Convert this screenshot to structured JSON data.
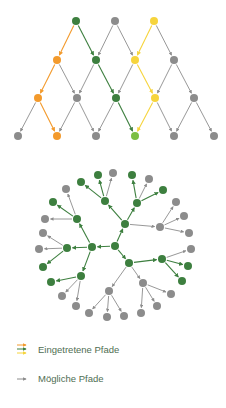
{
  "colors": {
    "green": "#3d7f3f",
    "gray": "#8c8c8c",
    "orange": "#f39a2c",
    "yellow": "#f6d43c",
    "light_green": "#7cbf43",
    "legend_text": "#4f6e52"
  },
  "lattice": {
    "nodes": [
      {
        "id": "r0a",
        "x": 76,
        "y": 21,
        "c": "green"
      },
      {
        "id": "r0b",
        "x": 115,
        "y": 21,
        "c": "gray"
      },
      {
        "id": "r0c",
        "x": 154,
        "y": 21,
        "c": "yellow"
      },
      {
        "id": "r1a",
        "x": 57,
        "y": 60,
        "c": "orange"
      },
      {
        "id": "r1b",
        "x": 96,
        "y": 60,
        "c": "green"
      },
      {
        "id": "r1c",
        "x": 135,
        "y": 60,
        "c": "yellow"
      },
      {
        "id": "r1d",
        "x": 174,
        "y": 60,
        "c": "gray"
      },
      {
        "id": "r2a",
        "x": 38,
        "y": 98,
        "c": "orange"
      },
      {
        "id": "r2b",
        "x": 77,
        "y": 98,
        "c": "gray"
      },
      {
        "id": "r2c",
        "x": 116,
        "y": 98,
        "c": "green"
      },
      {
        "id": "r2d",
        "x": 155,
        "y": 98,
        "c": "yellow"
      },
      {
        "id": "r2e",
        "x": 194,
        "y": 98,
        "c": "gray"
      },
      {
        "id": "r3a",
        "x": 18,
        "y": 136,
        "c": "gray"
      },
      {
        "id": "r3b",
        "x": 57,
        "y": 136,
        "c": "orange"
      },
      {
        "id": "r3c",
        "x": 96,
        "y": 136,
        "c": "gray"
      },
      {
        "id": "r3d",
        "x": 135,
        "y": 136,
        "c": "light_green"
      },
      {
        "id": "r3e",
        "x": 174,
        "y": 136,
        "c": "gray"
      },
      {
        "id": "r3f",
        "x": 214,
        "y": 136,
        "c": "gray"
      }
    ],
    "edges": [
      [
        "r0a",
        "r1a",
        "orange"
      ],
      [
        "r0a",
        "r1b",
        "green"
      ],
      [
        "r0b",
        "r1b",
        "gray"
      ],
      [
        "r0b",
        "r1c",
        "gray"
      ],
      [
        "r0c",
        "r1c",
        "yellow"
      ],
      [
        "r0c",
        "r1d",
        "gray"
      ],
      [
        "r1a",
        "r2a",
        "orange"
      ],
      [
        "r1a",
        "r2b",
        "gray"
      ],
      [
        "r1b",
        "r2b",
        "gray"
      ],
      [
        "r1b",
        "r2c",
        "green"
      ],
      [
        "r1c",
        "r2c",
        "gray"
      ],
      [
        "r1c",
        "r2d",
        "yellow"
      ],
      [
        "r1d",
        "r2d",
        "gray"
      ],
      [
        "r1d",
        "r2e",
        "gray"
      ],
      [
        "r2a",
        "r3a",
        "gray"
      ],
      [
        "r2a",
        "r3b",
        "orange"
      ],
      [
        "r2b",
        "r3b",
        "gray"
      ],
      [
        "r2b",
        "r3c",
        "gray"
      ],
      [
        "r2c",
        "r3c",
        "gray"
      ],
      [
        "r2c",
        "r3d",
        "green"
      ],
      [
        "r2d",
        "r3d",
        "yellow"
      ],
      [
        "r2d",
        "r3e",
        "gray"
      ],
      [
        "r2e",
        "r3e",
        "gray"
      ],
      [
        "r2e",
        "r3f",
        "gray"
      ]
    ]
  },
  "tree": {
    "nodes": [
      {
        "id": "c",
        "x": 115,
        "y": 246,
        "c": "green"
      },
      {
        "id": "n1",
        "x": 125,
        "y": 224,
        "c": "green"
      },
      {
        "id": "n2",
        "x": 92,
        "y": 247,
        "c": "green"
      },
      {
        "id": "n3",
        "x": 129,
        "y": 263,
        "c": "green"
      },
      {
        "id": "a1",
        "x": 105,
        "y": 201,
        "c": "green"
      },
      {
        "id": "a2",
        "x": 137,
        "y": 203,
        "c": "green"
      },
      {
        "id": "a3",
        "x": 160,
        "y": 227,
        "c": "gray"
      },
      {
        "id": "a4",
        "x": 77,
        "y": 219,
        "c": "green"
      },
      {
        "id": "a5",
        "x": 67,
        "y": 248,
        "c": "green"
      },
      {
        "id": "a6",
        "x": 81,
        "y": 276,
        "c": "green"
      },
      {
        "id": "a7",
        "x": 162,
        "y": 259,
        "c": "green"
      },
      {
        "id": "a8",
        "x": 143,
        "y": 283,
        "c": "gray"
      },
      {
        "id": "a9",
        "x": 109,
        "y": 291,
        "c": "gray"
      },
      {
        "id": "l1",
        "x": 98,
        "y": 175,
        "c": "green"
      },
      {
        "id": "l2",
        "x": 113,
        "y": 173,
        "c": "gray"
      },
      {
        "id": "l3",
        "x": 81,
        "y": 182,
        "c": "green"
      },
      {
        "id": "l4",
        "x": 132,
        "y": 175,
        "c": "green"
      },
      {
        "id": "l5",
        "x": 149,
        "y": 179,
        "c": "gray"
      },
      {
        "id": "l6",
        "x": 163,
        "y": 190,
        "c": "green"
      },
      {
        "id": "l7",
        "x": 176,
        "y": 202,
        "c": "gray"
      },
      {
        "id": "l8",
        "x": 184,
        "y": 216,
        "c": "gray"
      },
      {
        "id": "l9",
        "x": 189,
        "y": 233,
        "c": "gray"
      },
      {
        "id": "l10",
        "x": 66,
        "y": 189,
        "c": "gray"
      },
      {
        "id": "l11",
        "x": 53,
        "y": 202,
        "c": "green"
      },
      {
        "id": "l12",
        "x": 45,
        "y": 219,
        "c": "gray"
      },
      {
        "id": "l13",
        "x": 43,
        "y": 233,
        "c": "gray"
      },
      {
        "id": "l14",
        "x": 39,
        "y": 249,
        "c": "gray"
      },
      {
        "id": "l15",
        "x": 43,
        "y": 267,
        "c": "green"
      },
      {
        "id": "l16",
        "x": 51,
        "y": 282,
        "c": "green"
      },
      {
        "id": "l17",
        "x": 62,
        "y": 296,
        "c": "gray"
      },
      {
        "id": "l18",
        "x": 76,
        "y": 306,
        "c": "gray"
      },
      {
        "id": "l19",
        "x": 191,
        "y": 249,
        "c": "gray"
      },
      {
        "id": "l20",
        "x": 188,
        "y": 266,
        "c": "green"
      },
      {
        "id": "l21",
        "x": 182,
        "y": 281,
        "c": "green"
      },
      {
        "id": "l22",
        "x": 171,
        "y": 294,
        "c": "gray"
      },
      {
        "id": "l23",
        "x": 157,
        "y": 306,
        "c": "gray"
      },
      {
        "id": "l24",
        "x": 141,
        "y": 313,
        "c": "gray"
      },
      {
        "id": "l25",
        "x": 124,
        "y": 316,
        "c": "gray"
      },
      {
        "id": "l26",
        "x": 107,
        "y": 317,
        "c": "gray"
      },
      {
        "id": "l27",
        "x": 89,
        "y": 313,
        "c": "gray"
      }
    ],
    "edges": [
      [
        "c",
        "n1",
        "green"
      ],
      [
        "c",
        "n2",
        "green"
      ],
      [
        "c",
        "n3",
        "green"
      ],
      [
        "n1",
        "a1",
        "green"
      ],
      [
        "n1",
        "a2",
        "green"
      ],
      [
        "n1",
        "a3",
        "gray"
      ],
      [
        "n2",
        "a4",
        "green"
      ],
      [
        "n2",
        "a5",
        "green"
      ],
      [
        "n2",
        "a6",
        "green"
      ],
      [
        "n3",
        "a7",
        "green"
      ],
      [
        "n3",
        "a8",
        "gray"
      ],
      [
        "n3",
        "a9",
        "gray"
      ],
      [
        "a1",
        "l1",
        "green"
      ],
      [
        "a1",
        "l2",
        "gray"
      ],
      [
        "a1",
        "l3",
        "green"
      ],
      [
        "a2",
        "l4",
        "green"
      ],
      [
        "a2",
        "l5",
        "gray"
      ],
      [
        "a2",
        "l6",
        "green"
      ],
      [
        "a3",
        "l7",
        "gray"
      ],
      [
        "a3",
        "l8",
        "gray"
      ],
      [
        "a3",
        "l9",
        "gray"
      ],
      [
        "a4",
        "l10",
        "gray"
      ],
      [
        "a4",
        "l11",
        "green"
      ],
      [
        "a4",
        "l12",
        "gray"
      ],
      [
        "a5",
        "l13",
        "gray"
      ],
      [
        "a5",
        "l14",
        "gray"
      ],
      [
        "a5",
        "l15",
        "green"
      ],
      [
        "a6",
        "l16",
        "green"
      ],
      [
        "a6",
        "l17",
        "gray"
      ],
      [
        "a6",
        "l18",
        "gray"
      ],
      [
        "a7",
        "l19",
        "gray"
      ],
      [
        "a7",
        "l20",
        "green"
      ],
      [
        "a7",
        "l21",
        "green"
      ],
      [
        "a8",
        "l22",
        "gray"
      ],
      [
        "a8",
        "l23",
        "gray"
      ],
      [
        "a8",
        "l24",
        "gray"
      ],
      [
        "a9",
        "l25",
        "gray"
      ],
      [
        "a9",
        "l26",
        "gray"
      ],
      [
        "a9",
        "l27",
        "gray"
      ]
    ]
  },
  "legend": {
    "taken": {
      "label": "Eingetretene Pfade",
      "arrow_colors": [
        "orange",
        "green",
        "yellow"
      ]
    },
    "possible": {
      "label": "Mögliche Pfade",
      "arrow_colors": [
        "gray"
      ]
    }
  }
}
